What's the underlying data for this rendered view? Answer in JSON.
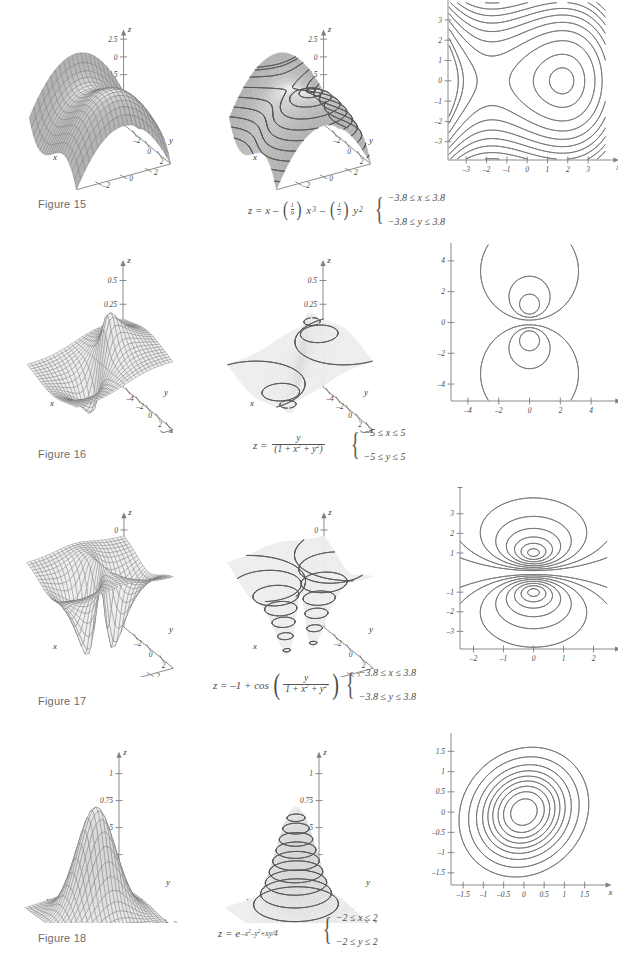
{
  "page": {
    "figures": [
      {
        "id": "figure-15",
        "label": "Figure 15",
        "equation_text": "z = x − (1/9)x³ − (1/2)y²",
        "domain_x": "−3.8 ≤ x ≤ 3.8",
        "domain_y": "−3.8 ≤ y ≤ 3.8",
        "wire": {
          "z_ticks": [
            "2.5",
            "0",
            "−2.5",
            "−5",
            "−7.5"
          ],
          "x_ticks": [
            "−2",
            "0",
            "2"
          ],
          "y_ticks": [
            "2",
            "0",
            "−2"
          ],
          "x_label": "x",
          "y_label": "y",
          "z_label": "z"
        },
        "contour3d": {
          "z_ticks": [
            "2.5",
            "0",
            "−2.5",
            "−5",
            "−7.5"
          ],
          "x_ticks": [
            "−2",
            "0",
            "2"
          ],
          "y_ticks": [
            "2",
            "0",
            "−2"
          ],
          "x_label": "x",
          "y_label": "y",
          "z_label": "z"
        },
        "contour2d": {
          "x_ticks": [
            "−3",
            "−2",
            "−1",
            "0",
            "1",
            "2",
            "3"
          ],
          "y_ticks": [
            "−3",
            "−2",
            "−1",
            "0",
            "1",
            "2",
            "3"
          ],
          "x_label": "x",
          "y_label": "y",
          "xlim": [
            -3.8,
            3.8
          ],
          "ylim": [
            -3.8,
            3.8
          ]
        }
      },
      {
        "id": "figure-16",
        "label": "Figure 16",
        "equation_text": "z = y / (1 + x² + y²)",
        "domain_x": "−5 ≤ x ≤ 5",
        "domain_y": "−5 ≤ y ≤ 5",
        "wire": {
          "z_ticks": [
            "0.5",
            "0.25",
            "0",
            "−0.25",
            "−0.5"
          ],
          "x_ticks": [
            "−4",
            "−2",
            "0",
            "2",
            "4"
          ],
          "y_ticks": [
            "4",
            "2",
            "0",
            "−2",
            "−4"
          ],
          "x_label": "x",
          "y_label": "y",
          "z_label": "z"
        },
        "contour3d": {
          "z_ticks": [
            "0.5",
            "0.25",
            "0",
            "−0.25",
            "−0.5"
          ],
          "x_ticks": [
            "−4",
            "−2",
            "0",
            "2",
            "4"
          ],
          "y_ticks": [
            "4",
            "2",
            "0",
            "−2",
            "−4"
          ],
          "x_label": "x",
          "y_label": "y",
          "z_label": "z"
        },
        "contour2d": {
          "x_ticks": [
            "−4",
            "−2",
            "0",
            "2",
            "4"
          ],
          "y_ticks": [
            "−4",
            "−2",
            "0",
            "2",
            "4"
          ],
          "x_label": "x",
          "y_label": "y",
          "xlim": [
            -5,
            5
          ],
          "ylim": [
            -5,
            5
          ]
        }
      },
      {
        "id": "figure-17",
        "label": "Figure 17",
        "equation_text": "z = −1 + cos( y / (1 + x² + y²) )",
        "domain_x": "−3.8 ≤ x ≤ 3.8",
        "domain_y": "−3.8 ≤ y ≤ 3.8",
        "wire": {
          "z_ticks": [
            "0",
            "−0.05",
            "−0.1"
          ],
          "x_ticks": [
            "−2",
            "0",
            "2"
          ],
          "y_ticks": [
            "2",
            "0",
            "−2"
          ],
          "x_label": "x",
          "y_label": "y",
          "z_label": "z"
        },
        "contour3d": {
          "z_ticks": [
            "0",
            "−0.05",
            "−0.1"
          ],
          "x_ticks": [
            "−2",
            "0",
            "2"
          ],
          "y_ticks": [
            "2",
            "0",
            "−2"
          ],
          "x_label": "x",
          "y_label": "y",
          "z_label": "z"
        },
        "contour2d": {
          "x_ticks": [
            "−2",
            "−1",
            "0",
            "1",
            "2"
          ],
          "y_ticks": [
            "−3",
            "−2",
            "−1",
            "1",
            "2",
            "3"
          ],
          "x_label": "x",
          "y_label": "y",
          "xlim": [
            -2.4,
            2.4
          ],
          "ylim": [
            -3.8,
            3.8
          ]
        }
      },
      {
        "id": "figure-18",
        "label": "Figure 18",
        "equation_text": "z = e^(−x² − y² + xy/4)",
        "domain_x": "−2 ≤ x ≤ 2",
        "domain_y": "−2 ≤ y ≤ 2",
        "wire": {
          "z_ticks": [
            "1",
            "0.75",
            "0.5",
            "0.25",
            "0"
          ],
          "x_ticks": [
            "−2",
            "−1",
            "0",
            "1",
            "2"
          ],
          "y_ticks": [
            "2",
            "1",
            "0",
            "−1",
            "−2"
          ],
          "x_label": "x",
          "y_label": "y",
          "z_label": "z"
        },
        "contour3d": {
          "z_ticks": [
            "1",
            "0.75",
            "0.5",
            "0.25",
            "0"
          ],
          "x_ticks": [
            "−2",
            "−1",
            "0",
            "1",
            "2"
          ],
          "y_ticks": [
            "2",
            "1",
            "0",
            "−1",
            "−2"
          ],
          "x_label": "x",
          "y_label": "y",
          "z_label": "z"
        },
        "contour2d": {
          "x_ticks": [
            "−1.5",
            "−1",
            "−0.5",
            "0",
            "0.5",
            "1",
            "1.5"
          ],
          "y_ticks": [
            "−1.5",
            "−1",
            "−0.5",
            "0",
            "0.5",
            "1",
            "1.5"
          ],
          "x_label": "x",
          "y_label": "y",
          "xlim": [
            -1.8,
            1.8
          ],
          "ylim": [
            -1.8,
            1.8
          ]
        }
      }
    ],
    "colors": {
      "surface_light": "#dcdcdc",
      "surface_mid": "#c4c4c4",
      "surface_dark": "#a8a8a8",
      "mesh_line": "#6a6a6a",
      "contour_line": "#6f6f6f",
      "axis": "#7e7e7e",
      "text": "#3a3a3a",
      "figure_label": "#6d6d6d"
    }
  },
  "chart_data": [
    {
      "type": "surface",
      "title": "Figure 15",
      "function": "z = x - (1/9)x^3 - (1/2)y^2",
      "xlabel": "x",
      "ylabel": "y",
      "zlabel": "z",
      "xlim": [
        -3.8,
        3.8
      ],
      "ylim": [
        -3.8,
        3.8
      ],
      "zticks": [
        2.5,
        0,
        -2.5,
        -5,
        -7.5
      ],
      "xticks": [
        -2,
        0,
        2
      ],
      "yticks": [
        2,
        0,
        -2
      ],
      "contour_levels": [
        -8,
        -6.5,
        -5,
        -3.5,
        -2,
        -0.5,
        0.5,
        1.2,
        1.8
      ],
      "critical_points": [
        {
          "type": "local maximum",
          "x": 1.732,
          "y": 0,
          "z": 1.155
        },
        {
          "type": "saddle",
          "x": -1.732,
          "y": 0,
          "z": -1.155
        }
      ]
    },
    {
      "type": "surface",
      "title": "Figure 16",
      "function": "z = y / (1 + x^2 + y^2)",
      "xlabel": "x",
      "ylabel": "y",
      "zlabel": "z",
      "xlim": [
        -5,
        5
      ],
      "ylim": [
        -5,
        5
      ],
      "zticks": [
        0.5,
        0.25,
        0,
        -0.25,
        -0.5
      ],
      "xticks": [
        -4,
        -2,
        0,
        2,
        4
      ],
      "yticks": [
        4,
        2,
        0,
        -2,
        -4
      ],
      "contour_levels": [
        -0.4,
        -0.3,
        -0.15,
        0,
        0.15,
        0.3,
        0.4
      ],
      "critical_points": [
        {
          "type": "maximum",
          "x": 0,
          "y": 1,
          "z": 0.5
        },
        {
          "type": "minimum",
          "x": 0,
          "y": -1,
          "z": -0.5
        }
      ]
    },
    {
      "type": "surface",
      "title": "Figure 17",
      "function": "z = -1 + cos(y / (1 + x^2 + y^2))",
      "xlabel": "x",
      "ylabel": "y",
      "zlabel": "z",
      "xlim": [
        -3.8,
        3.8
      ],
      "ylim": [
        -3.8,
        3.8
      ],
      "zticks": [
        0,
        -0.05,
        -0.1
      ],
      "xticks": [
        -2,
        0,
        2
      ],
      "yticks": [
        2,
        0,
        -2
      ],
      "contour_levels": [
        -0.11,
        -0.09,
        -0.07,
        -0.05,
        -0.03,
        -0.015,
        -0.005
      ],
      "critical_points": [
        {
          "type": "minimum",
          "x": 0,
          "y": 1,
          "z": -0.1224
        },
        {
          "type": "minimum",
          "x": 0,
          "y": -1,
          "z": -0.1224
        }
      ]
    },
    {
      "type": "surface",
      "title": "Figure 18",
      "function": "z = e^(-x^2 - y^2 + xy/4)",
      "xlabel": "x",
      "ylabel": "y",
      "zlabel": "z",
      "xlim": [
        -2,
        2
      ],
      "ylim": [
        -2,
        2
      ],
      "zticks": [
        1,
        0.75,
        0.5,
        0.25,
        0
      ],
      "xticks": [
        -2,
        -1,
        0,
        1,
        2
      ],
      "yticks": [
        2,
        1,
        0,
        -1,
        -2
      ],
      "contour_levels": [
        0.1,
        0.2,
        0.3,
        0.4,
        0.5,
        0.6,
        0.7,
        0.8,
        0.9
      ],
      "critical_points": [
        {
          "type": "maximum",
          "x": 0,
          "y": 0,
          "z": 1
        }
      ]
    }
  ]
}
